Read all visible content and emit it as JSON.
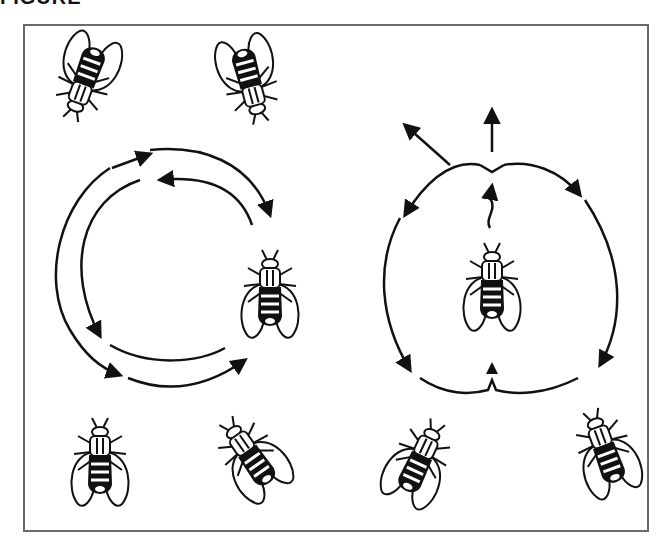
{
  "figure": {
    "title_cropped": "FIGURE",
    "panels": [
      {
        "id": "left",
        "description": "Fly circling behavior with two concentric circular arrows (clockwise outer, counter-clockwise inner)",
        "flies": [
          "top-left-fly",
          "top-right-fly",
          "right-fly",
          "bottom-left-fly",
          "bottom-right-fly"
        ]
      },
      {
        "id": "right",
        "description": "Central fly with branching escape directions and four curved arrows",
        "flies": [
          "center-fly",
          "bottom-left-fly",
          "bottom-right-fly"
        ]
      }
    ],
    "colors": {
      "ink": "#111111",
      "frame": "#6a6a6a",
      "background": "#ffffff"
    }
  }
}
